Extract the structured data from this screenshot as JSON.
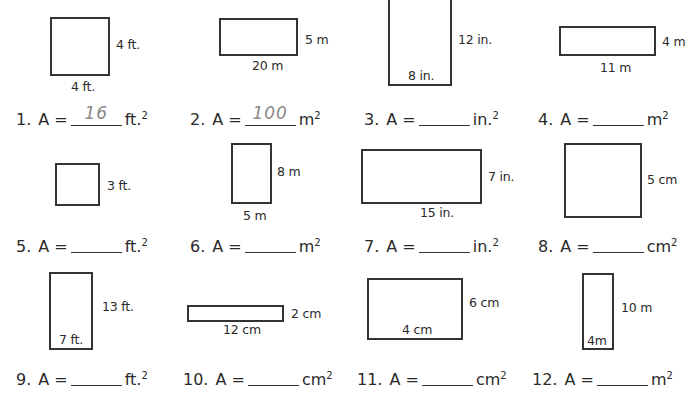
{
  "worksheet": {
    "problems": [
      {
        "number": "1.",
        "label": "A =",
        "answer": "16",
        "unit": "ft.",
        "exp": "2",
        "width_label": "4 ft.",
        "height_label": "4 ft."
      },
      {
        "number": "2.",
        "label": "A =",
        "answer": "100",
        "unit": "m",
        "exp": "2",
        "width_label": "20 m",
        "height_label": "5 m"
      },
      {
        "number": "3.",
        "label": "A =",
        "answer": "",
        "unit": "in.",
        "exp": "2",
        "width_label": "8 in.",
        "height_label": "12 in."
      },
      {
        "number": "4.",
        "label": "A =",
        "answer": "",
        "unit": "m",
        "exp": "2",
        "width_label": "11 m",
        "height_label": "4 m"
      },
      {
        "number": "5.",
        "label": "A =",
        "answer": "",
        "unit": "ft.",
        "exp": "2",
        "width_label": "",
        "height_label": "3 ft."
      },
      {
        "number": "6.",
        "label": "A =",
        "answer": "",
        "unit": "m",
        "exp": "2",
        "width_label": "5 m",
        "height_label": "8 m"
      },
      {
        "number": "7.",
        "label": "A =",
        "answer": "",
        "unit": "in.",
        "exp": "2",
        "width_label": "15 in.",
        "height_label": "7 in."
      },
      {
        "number": "8.",
        "label": "A =",
        "answer": "",
        "unit": "cm",
        "exp": "2",
        "width_label": "",
        "height_label": "5 cm"
      },
      {
        "number": "9.",
        "label": "A =",
        "answer": "",
        "unit": "ft.",
        "exp": "2",
        "width_label": "7 ft.",
        "height_label": "13 ft."
      },
      {
        "number": "10.",
        "label": "A =",
        "answer": "",
        "unit": "cm",
        "exp": "2",
        "width_label": "12 cm",
        "height_label": "2 cm"
      },
      {
        "number": "11.",
        "label": "A =",
        "answer": "",
        "unit": "cm",
        "exp": "2",
        "width_label": "4 cm",
        "height_label": "6 cm"
      },
      {
        "number": "12.",
        "label": "A =",
        "answer": "",
        "unit": "m",
        "exp": "2",
        "width_label": "4m",
        "height_label": "10 m"
      }
    ]
  }
}
